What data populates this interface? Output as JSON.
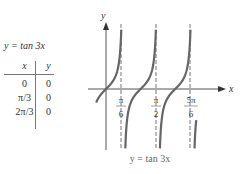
{
  "table": {
    "title": "y = tan 3x",
    "headers": [
      "x",
      "y"
    ],
    "rows": [
      {
        "x": "0",
        "y": "0"
      },
      {
        "x": "π/3",
        "y": "0"
      },
      {
        "x": "2π/3",
        "y": "0"
      }
    ]
  },
  "chart_data": {
    "type": "line",
    "title": "y = tan 3x",
    "xlabel": "x",
    "ylabel": "y",
    "function": "tan(3x)",
    "asymptotes": [
      "π/6",
      "π/2",
      "5π/6"
    ],
    "x_tick_labels": [
      {
        "num": "π",
        "den": "6"
      },
      {
        "num": "π",
        "den": "2"
      },
      {
        "num": "5π",
        "den": "6"
      }
    ],
    "zeros": [
      "0",
      "π/3",
      "2π/3"
    ],
    "xlim": [
      "-π/18",
      "8π/9"
    ],
    "grid": false,
    "curve_color": "#666666",
    "asymptote_style": "dashed"
  },
  "caption": "y = tan 3x"
}
